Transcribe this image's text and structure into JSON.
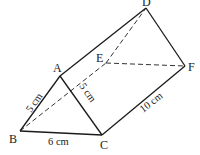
{
  "figure": {
    "type": "triangular-prism",
    "vertices": {
      "A": {
        "label": "A",
        "x": 60,
        "y": 76
      },
      "B": {
        "label": "B",
        "x": 20,
        "y": 131
      },
      "C": {
        "label": "C",
        "x": 102,
        "y": 135
      },
      "D": {
        "label": "D",
        "x": 146,
        "y": 8
      },
      "E": {
        "label": "E",
        "x": 106,
        "y": 63
      },
      "F": {
        "label": "F",
        "x": 185,
        "y": 66
      }
    },
    "measurements": {
      "AB": "5 cm",
      "AC": "5 cm",
      "BC": "6 cm",
      "CF": "10 cm"
    },
    "colors": {
      "line": "#1a1a1a",
      "background": "#ffffff"
    }
  }
}
